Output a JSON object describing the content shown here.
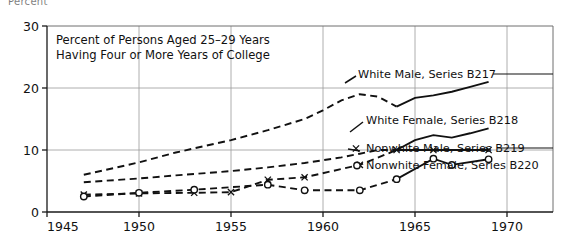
{
  "figure": {
    "cropped_top_text": "Percent",
    "title_line1": "Percent of Persons Aged 25–29 Years",
    "title_line2": "Having Four or More Years of College"
  },
  "chart_data": {
    "type": "line",
    "xlabel": "",
    "ylabel": "Percent",
    "xlim": [
      1945,
      1972.5
    ],
    "ylim": [
      0,
      30
    ],
    "xticks": [
      1945,
      1950,
      1955,
      1960,
      1965,
      1970
    ],
    "xticklabels": [
      "1945",
      "1950",
      "1955",
      "1960",
      "1965",
      "1970"
    ],
    "yticks": [
      0,
      10,
      20,
      30
    ],
    "yticklabels": [
      "0",
      "10",
      "20",
      "30"
    ],
    "grid": true,
    "legend_position": "right-inline",
    "series": [
      {
        "name": "White Male, Series B217",
        "label": "White Male, Series B217",
        "marker": "none",
        "x": [
          1947,
          1950,
          1952,
          1955,
          1957,
          1959,
          1960,
          1961,
          1962,
          1963,
          1964,
          1965,
          1966,
          1967,
          1968,
          1969
        ],
        "values": [
          6.0,
          8.0,
          9.6,
          11.6,
          13.2,
          15.0,
          16.4,
          18.0,
          19.0,
          18.6,
          17.0,
          18.4,
          18.8,
          19.4,
          20.2,
          21.0
        ]
      },
      {
        "name": "White Female, Series B218",
        "label": "White Female, Series B218",
        "marker": "none",
        "x": [
          1947,
          1950,
          1952,
          1955,
          1957,
          1959,
          1961,
          1962,
          1963,
          1964,
          1965,
          1966,
          1967,
          1968,
          1969
        ],
        "values": [
          4.8,
          5.4,
          5.9,
          6.6,
          7.2,
          7.9,
          8.8,
          9.4,
          10.0,
          10.0,
          11.6,
          12.4,
          12.0,
          12.7,
          13.5
        ]
      },
      {
        "name": "Nonwhite Male, Series B219",
        "label": "Nonwhite Male, Series B219",
        "marker": "x",
        "x": [
          1947,
          1950,
          1953,
          1955,
          1957,
          1959,
          1962,
          1964,
          1966,
          1969
        ],
        "values": [
          2.8,
          3.0,
          3.1,
          3.2,
          5.2,
          5.6,
          7.6,
          10.0,
          10.0,
          10.0
        ]
      },
      {
        "name": "Nonwhite Female, Series B220",
        "label": "Nonwhite Female, Series B220",
        "marker": "o",
        "x": [
          1947,
          1950,
          1953,
          1957,
          1959,
          1962,
          1964,
          1966,
          1967,
          1969
        ],
        "values": [
          2.5,
          3.1,
          3.6,
          4.4,
          3.5,
          3.5,
          5.3,
          8.6,
          7.6,
          8.5
        ]
      }
    ],
    "annotations": [
      "Dashed segments denote years prior to 1964; solid segments denote 1964 onward."
    ]
  },
  "legend": {
    "entries": [
      {
        "label": "White Male, Series B217"
      },
      {
        "label": "White Female, Series B218"
      },
      {
        "label": "Nonwhite Male, Series B219"
      },
      {
        "label": "Nonwhite Female, Series B220"
      }
    ]
  }
}
